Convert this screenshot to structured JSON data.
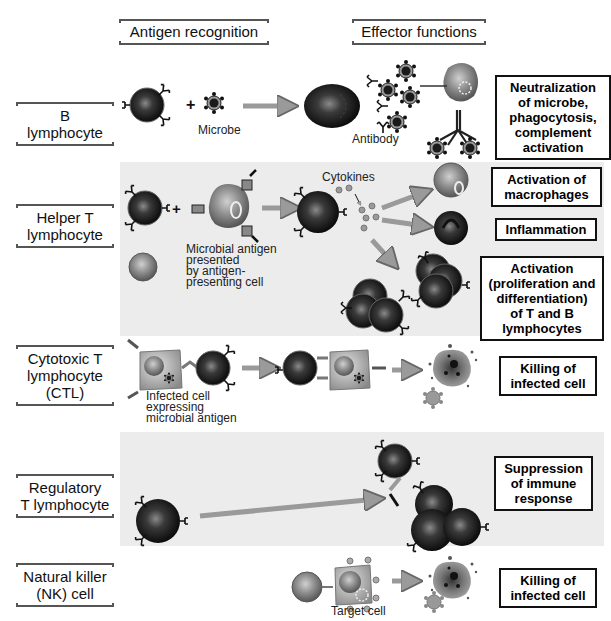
{
  "headers": {
    "antigen_recognition": "Antigen recognition",
    "effector_functions": "Effector functions"
  },
  "rows": [
    {
      "id": "b-lymphocyte",
      "label_line1": "B",
      "label_line2": "lymphocyte",
      "captions": {
        "microbe": "Microbe",
        "antibody": "Antibody"
      },
      "outcomes": [
        "Neutralization of microbe, phagocytosis, complement activation"
      ],
      "outcome_lines": [
        "Neutralization",
        "of microbe,",
        "phagocytosis,",
        "complement",
        "activation"
      ],
      "shaded": false
    },
    {
      "id": "helper-t-lymphocyte",
      "label_line1": "Helper T",
      "label_line2": "lymphocyte",
      "captions": {
        "cytokines": "Cytokines",
        "antigen_line1": "Microbial antigen",
        "antigen_line2": "presented",
        "antigen_line3": "by antigen-",
        "antigen_line4": "presenting cell"
      },
      "outcomes": [
        {
          "lines": [
            "Activation of",
            "macrophages"
          ]
        },
        {
          "lines": [
            "Inflammation"
          ]
        },
        {
          "lines": [
            "Activation",
            "(proliferation and",
            "differentiation)",
            "of T and B",
            "lymphocytes"
          ]
        }
      ],
      "shaded": true
    },
    {
      "id": "cytotoxic-t-lymphocyte",
      "label_line1": "Cytotoxic T",
      "label_line2": "lymphocyte",
      "label_line3": "(CTL)",
      "captions": {
        "infected_line1": "Infected cell",
        "infected_line2": "expressing",
        "infected_line3": "microbial antigen"
      },
      "outcome_lines": [
        "Killing of",
        "infected cell"
      ],
      "shaded": false
    },
    {
      "id": "regulatory-t-lymphocyte",
      "label_line1": "Regulatory",
      "label_line2": "T lymphocyte",
      "outcome_lines": [
        "Suppression",
        "of immune",
        "response"
      ],
      "shaded": true
    },
    {
      "id": "natural-killer-cell",
      "label_line1": "Natural killer",
      "label_line2": "(NK) cell",
      "captions": {
        "target_cell": "Target cell"
      },
      "outcome_lines": [
        "Killing of",
        "infected cell"
      ],
      "shaded": false
    }
  ],
  "colors": {
    "band": "#ececec",
    "arrow": "#9a9a9a",
    "lymphocyte": "#1a1a1a",
    "apc": "#8a8a8a",
    "box_border": "#111111"
  }
}
